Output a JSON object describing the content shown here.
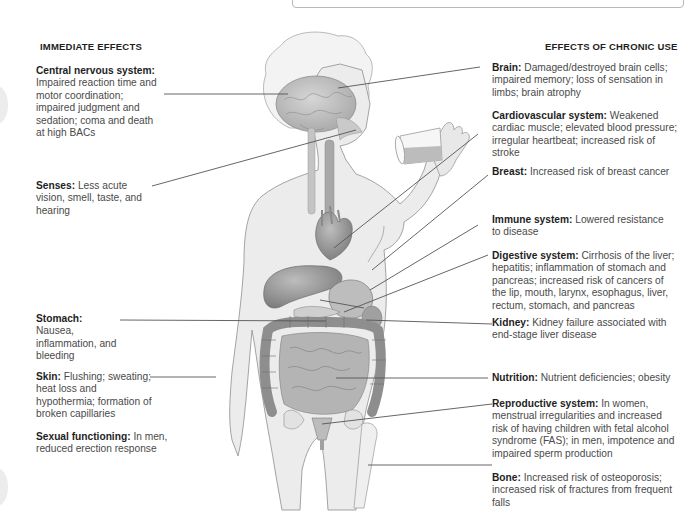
{
  "left_column": {
    "heading": "IMMEDIATE EFFECTS",
    "entries": [
      {
        "term": "Central nervous system:",
        "text": "Impaired reaction time and motor coordination; impaired judgment and sedation; coma and death at high BACs"
      },
      {
        "term": "Senses:",
        "text": "Less acute vision, smell, taste, and hearing"
      },
      {
        "term": "Stomach:",
        "text": "Nausea, inflammation, and bleeding"
      },
      {
        "term": "Skin:",
        "text": "Flushing; sweating; heat loss and hypothermia; formation of broken capillaries"
      },
      {
        "term": "Sexual functioning:",
        "text": "In men, reduced erection response"
      }
    ]
  },
  "right_column": {
    "heading": "EFFECTS OF CHRONIC USE",
    "entries": [
      {
        "term": "Brain:",
        "text": "Damaged/destroyed brain cells; impaired memory; loss of sensation in limbs; brain atrophy"
      },
      {
        "term": "Cardiovascular system:",
        "text": "Weakened cardiac muscle; elevated blood pressure; irregular heartbeat; increased risk of stroke"
      },
      {
        "term": "Breast:",
        "text": "Increased risk of breast cancer"
      },
      {
        "term": "Immune system:",
        "text": "Lowered resistance to disease"
      },
      {
        "term": "Digestive system:",
        "text": "Cirrhosis of the liver; hepatitis; inflammation of stomach and pancreas; increased risk of cancers of the lip, mouth, larynx, esophagus, liver, rectum, stomach, and pancreas"
      },
      {
        "term": "Kidney:",
        "text": "Kidney failure associated with end-stage liver disease"
      },
      {
        "term": "Nutrition:",
        "text": "Nutrient deficiencies; obesity"
      },
      {
        "term": "Reproductive system:",
        "text": "In women, menstrual irregularities and increased risk of having children with fetal alcohol syndrome (FAS); in men, impotence and impaired sperm production"
      },
      {
        "term": "Bone:",
        "text": "Increased risk of osteoporosis; increased risk of fractures from frequent falls"
      }
    ]
  },
  "figure": {
    "organs": [
      "brain",
      "esophagus",
      "heart",
      "liver",
      "stomach",
      "pancreas",
      "kidney",
      "large-intestine",
      "small-intestine",
      "uterus",
      "pelvis",
      "femur"
    ]
  },
  "colors": {
    "body_fill": "#ececec",
    "body_outline": "#9a9a9a",
    "organ_fill": "#9c9c9c",
    "organ_dark": "#7a7a7a",
    "leader_line": "#555555",
    "heading_text": "#1e1e1e",
    "body_text": "#4a4a4a"
  }
}
